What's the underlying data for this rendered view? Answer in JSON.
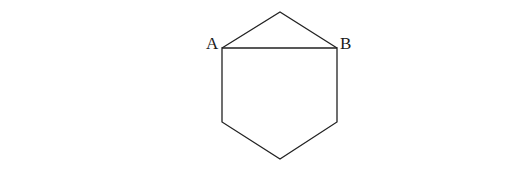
{
  "diagram": {
    "labels": {
      "A": "A",
      "B": "B"
    },
    "stroke_color": "#222222",
    "vertices": {
      "triangle_apex": [
        280,
        12
      ],
      "A": [
        222,
        48
      ],
      "B": [
        337,
        48
      ],
      "right_lower": [
        336,
        122
      ],
      "bottom": [
        280,
        159
      ],
      "left_lower": [
        222,
        122
      ]
    }
  }
}
